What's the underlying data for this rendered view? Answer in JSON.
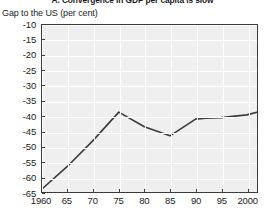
{
  "chart_data": {
    "type": "line",
    "title": "A. Convergence in GDP per capita is slow",
    "subtitle": "Gap to the US (per cent)",
    "xlabel": "",
    "ylabel": "Gap to the US (per cent)",
    "xlim": [
      1960,
      2002
    ],
    "ylim": [
      -65,
      -10
    ],
    "ytick_values": [
      -10,
      -15,
      -20,
      -25,
      -30,
      -35,
      -40,
      -45,
      -50,
      -55,
      -60,
      -65
    ],
    "ytick_labels": [
      "-10",
      "-15",
      "-20",
      "-25",
      "-30",
      "-35",
      "-40",
      "-45",
      "-50",
      "-55",
      "-60",
      "-65"
    ],
    "xtick_values": [
      1960,
      1965,
      1970,
      1975,
      1980,
      1985,
      1990,
      1995,
      2000
    ],
    "xtick_labels": [
      "1960",
      "65",
      "70",
      "75",
      "80",
      "85",
      "90",
      "95",
      "2000"
    ],
    "grid": true,
    "legend": false,
    "series": [
      {
        "name": "Gap to the US",
        "x": [
          1960,
          1965,
          1970,
          1975,
          1980,
          1985,
          1990,
          1992,
          1995,
          2000,
          2002
        ],
        "values": [
          -64.0,
          -56.5,
          -48.0,
          -38.7,
          -43.5,
          -46.5,
          -41.0,
          -40.7,
          -40.5,
          -39.6,
          -38.7
        ],
        "color": "#3b3b3b"
      }
    ],
    "colors": {
      "line": "#3b3b3b",
      "plot_background": "#efefef",
      "gridline": "#ffffff",
      "axis": "#3b3b3b",
      "text": "#1b1b1b",
      "page_background": "#ffffff"
    }
  }
}
